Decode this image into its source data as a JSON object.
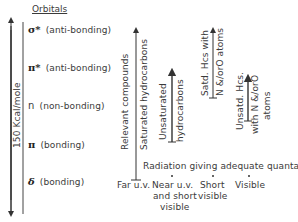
{
  "orbitals": {
    "title": "Orbitals",
    "energy_axis_label": "150 Kcal/mole",
    "levels": [
      {
        "symbol": "σ*",
        "label": "(anti-bonding)"
      },
      {
        "symbol": "π*",
        "label": "(anti-bonding)"
      },
      {
        "symbol": "n",
        "label": "(non-bonding)"
      },
      {
        "symbol": "π",
        "label": "(bonding)"
      },
      {
        "symbol": "δ",
        "label": "(bonding)"
      }
    ]
  },
  "compounds": {
    "header": "Relevant compounds",
    "items": [
      {
        "label": "Saturated hydrocarbons"
      },
      {
        "label_line1": "Unsaturated",
        "label_line2": "hydrocarbons"
      },
      {
        "label_line1": "Satd. Hcs with",
        "label_line2": "N &/orO atoms"
      },
      {
        "label_line1": "Unsatd. Hcs.",
        "label_line2": "with N &/orO",
        "label_line3": "atoms"
      }
    ]
  },
  "radiation": {
    "header": "Radiation giving adequate quanta",
    "regions": [
      {
        "lines": [
          "Far u.v."
        ]
      },
      {
        "lines": [
          "Near u.v.",
          "and short",
          "visible"
        ]
      },
      {
        "lines": [
          "Short",
          "visible"
        ]
      },
      {
        "lines": [
          "Visible"
        ]
      }
    ]
  }
}
